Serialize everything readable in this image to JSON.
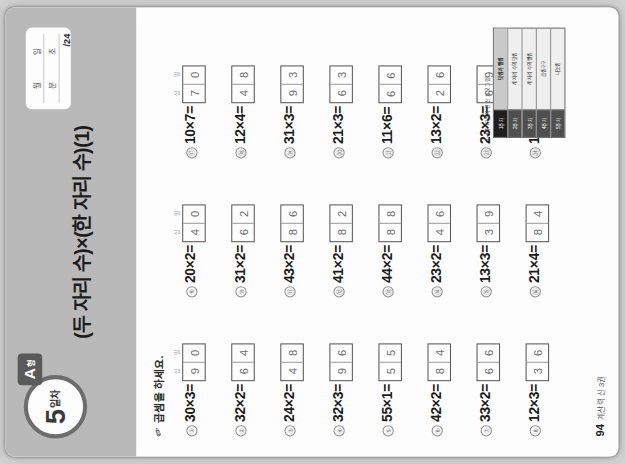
{
  "header": {
    "day_number": "5",
    "day_unit": "일차",
    "form_letter": "A",
    "form_suffix": "형",
    "title": "(두 자리 수)×(한 자리 수)(1)",
    "score_box": {
      "month_label": "월",
      "day_label": "일",
      "minute_label": "분",
      "second_label": "초",
      "total": "/24"
    }
  },
  "instruction": {
    "icon": "pencil-icon",
    "text": "곱셈을 하세요."
  },
  "place_labels": {
    "tens": "십",
    "ones": "일"
  },
  "problems": [
    {
      "num": "①",
      "expr": "30×3=",
      "tens": "9",
      "ones": "0",
      "show_labels": true
    },
    {
      "num": "②",
      "expr": "32×2=",
      "tens": "6",
      "ones": "4",
      "show_labels": false
    },
    {
      "num": "③",
      "expr": "24×2=",
      "tens": "4",
      "ones": "8",
      "show_labels": false
    },
    {
      "num": "④",
      "expr": "32×3=",
      "tens": "9",
      "ones": "6",
      "show_labels": false
    },
    {
      "num": "⑤",
      "expr": "55×1=",
      "tens": "5",
      "ones": "5",
      "show_labels": false
    },
    {
      "num": "⑥",
      "expr": "42×2=",
      "tens": "8",
      "ones": "4",
      "show_labels": false
    },
    {
      "num": "⑦",
      "expr": "33×2=",
      "tens": "6",
      "ones": "6",
      "show_labels": false
    },
    {
      "num": "⑧",
      "expr": "12×3=",
      "tens": "3",
      "ones": "6",
      "show_labels": false
    },
    {
      "num": "⑨",
      "expr": "20×2=",
      "tens": "4",
      "ones": "0",
      "show_labels": true
    },
    {
      "num": "⑩",
      "expr": "31×2=",
      "tens": "6",
      "ones": "2",
      "show_labels": false
    },
    {
      "num": "⑪",
      "expr": "43×2=",
      "tens": "8",
      "ones": "6",
      "show_labels": false
    },
    {
      "num": "⑫",
      "expr": "41×2=",
      "tens": "8",
      "ones": "2",
      "show_labels": false
    },
    {
      "num": "⑬",
      "expr": "44×2=",
      "tens": "8",
      "ones": "8",
      "show_labels": false
    },
    {
      "num": "⑭",
      "expr": "23×2=",
      "tens": "4",
      "ones": "6",
      "show_labels": false
    },
    {
      "num": "⑮",
      "expr": "13×3=",
      "tens": "3",
      "ones": "9",
      "show_labels": false
    },
    {
      "num": "⑯",
      "expr": "21×4=",
      "tens": "8",
      "ones": "4",
      "show_labels": false
    },
    {
      "num": "⑰",
      "expr": "10×7=",
      "tens": "7",
      "ones": "0",
      "show_labels": true
    },
    {
      "num": "⑱",
      "expr": "12×4=",
      "tens": "4",
      "ones": "8",
      "show_labels": false
    },
    {
      "num": "⑲",
      "expr": "31×3=",
      "tens": "9",
      "ones": "3",
      "show_labels": false
    },
    {
      "num": "⑳",
      "expr": "21×3=",
      "tens": "6",
      "ones": "3",
      "show_labels": false
    },
    {
      "num": "㉑",
      "expr": "11×6=",
      "tens": "6",
      "ones": "6",
      "show_labels": false
    },
    {
      "num": "㉒",
      "expr": "13×2=",
      "tens": "2",
      "ones": "6",
      "show_labels": false
    },
    {
      "num": "㉓",
      "expr": "23×3=",
      "tens": "6",
      "ones": "9",
      "show_labels": false
    },
    {
      "num": "㉔",
      "expr": "14×2=",
      "tens": "2",
      "ones": "8",
      "show_labels": false
    }
  ],
  "index_strip": {
    "caption": "1~4주 12주차 연산 프로그램",
    "rows": [
      {
        "bar": "1주차",
        "label": "덧셈과 뺄셈",
        "active": true
      },
      {
        "bar": "2주차",
        "label": "세 자리 수의 덧셈",
        "active": false
      },
      {
        "bar": "3주차",
        "label": "세 자리 수의 뺄셈",
        "active": false
      },
      {
        "bar": "4주차",
        "label": "곱셈구구",
        "active": false
      },
      {
        "bar": "5주차",
        "label": "나눗셈",
        "active": false
      }
    ]
  },
  "footer": {
    "page_number": "94",
    "book_title": "계산력 신 3권"
  },
  "colors": {
    "header_band": "#b9b9b9",
    "form_tab": "#5a5a5a",
    "paper": "#fdfdfd",
    "backdrop": "#d2d2d2",
    "answer_text": "#6b6b6b"
  }
}
